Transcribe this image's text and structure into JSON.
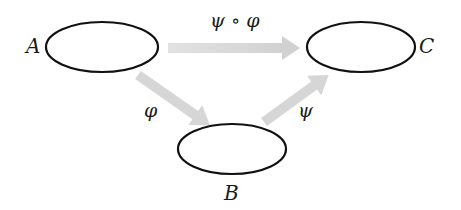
{
  "diagram": {
    "type": "commutative-diagram",
    "nodes": [
      {
        "id": "A",
        "label": "A"
      },
      {
        "id": "B",
        "label": "B"
      },
      {
        "id": "C",
        "label": "C"
      }
    ],
    "edges": [
      {
        "from": "A",
        "to": "C",
        "label": "ψ ∘ φ"
      },
      {
        "from": "A",
        "to": "B",
        "label": "φ"
      },
      {
        "from": "B",
        "to": "C",
        "label": "ψ"
      }
    ]
  },
  "colors": {
    "ellipse_stroke": "#111111",
    "arrow_fill": "#d4d4d4",
    "text": "#1a1a1a",
    "background": "#ffffff"
  }
}
